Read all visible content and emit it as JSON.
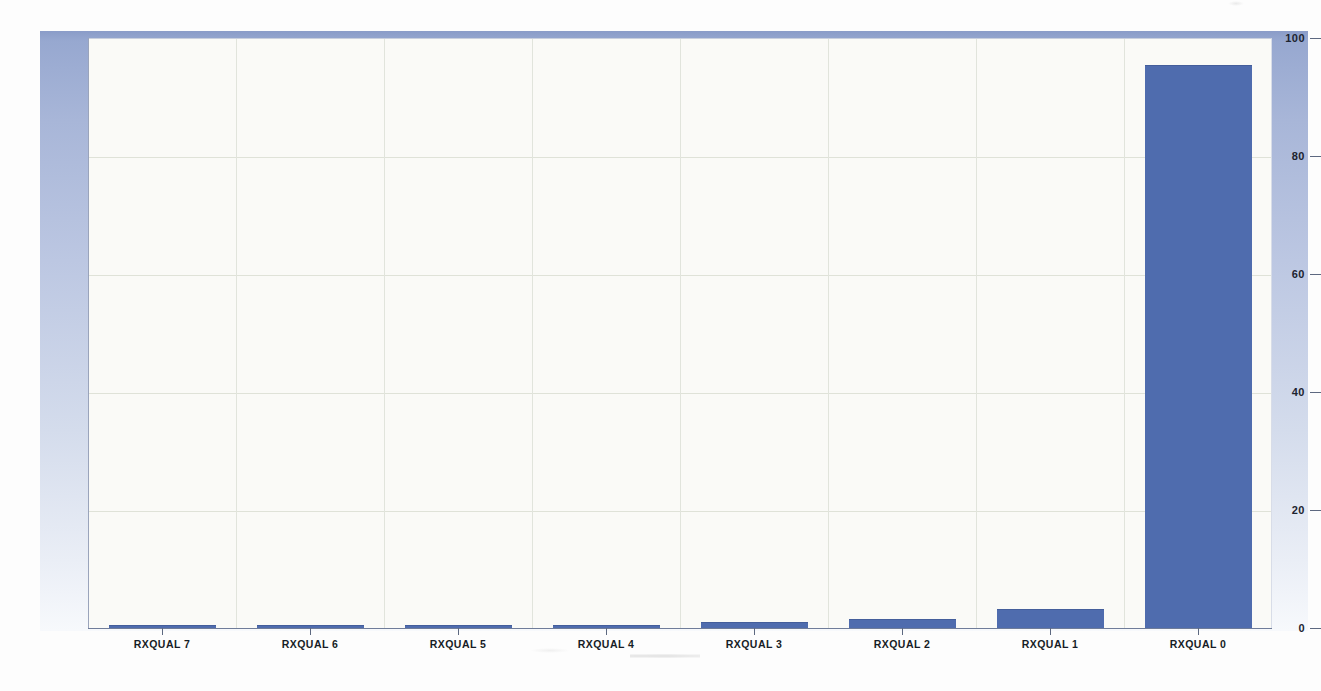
{
  "chart_data": {
    "type": "bar",
    "title": "",
    "subtitle": "",
    "xlabel": "",
    "ylabel": "",
    "categories": [
      "RXQUAL 7",
      "RXQUAL 6",
      "RXQUAL 5",
      "RXQUAL 4",
      "RXQUAL 3",
      "RXQUAL 2",
      "RXQUAL 1",
      "RXQUAL 0"
    ],
    "values": [
      0.1,
      0.2,
      0.2,
      0.4,
      0.8,
      1.4,
      3.0,
      95.3
    ],
    "series": [
      {
        "name": "RXQUAL distribution",
        "values": [
          0.1,
          0.2,
          0.2,
          0.4,
          0.8,
          1.4,
          3.0,
          95.3
        ]
      }
    ],
    "ylim": [
      0,
      100
    ],
    "yticks": [
      0,
      20,
      40,
      60,
      80,
      100
    ],
    "ytick_labels": [
      "0",
      "20",
      "40",
      "60",
      "80",
      "100"
    ],
    "grid": true,
    "legend": false,
    "legend_position": "none",
    "bar_color": "#4f6cae",
    "plot_background": "#fafaf7",
    "frame_color": "#97a8d0",
    "annotations": []
  },
  "axis": {
    "y_tick_labels": [
      "100",
      "80",
      "60",
      "40",
      "20",
      "0"
    ],
    "x_tick_labels": [
      "RXQUAL 7",
      "RXQUAL 6",
      "RXQUAL 5",
      "RXQUAL 4",
      "RXQUAL 3",
      "RXQUAL 2",
      "RXQUAL 1",
      "RXQUAL 0"
    ]
  }
}
